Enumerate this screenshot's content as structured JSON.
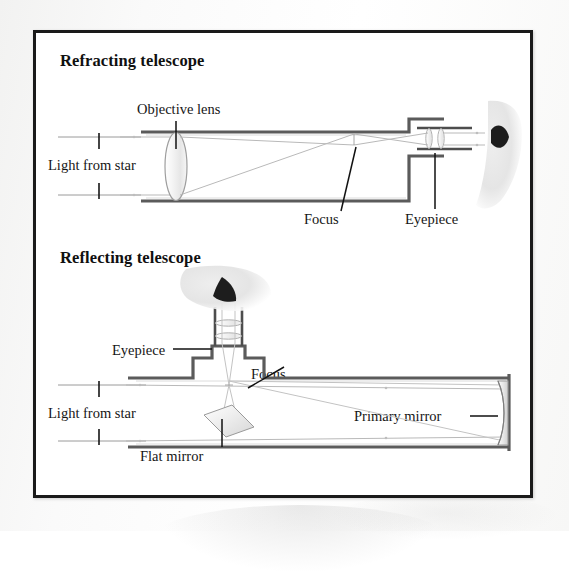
{
  "figure": {
    "panels": [
      {
        "id": "refracting",
        "title": "Refracting telescope",
        "labels": {
          "objective_lens": "Objective lens",
          "light_from_star": "Light from star",
          "focus": "Focus",
          "eyepiece": "Eyepiece"
        }
      },
      {
        "id": "reflecting",
        "title": "Reflecting telescope",
        "labels": {
          "eyepiece": "Eyepiece",
          "focus": "Focus",
          "light_from_star": "Light from star",
          "flat_mirror": "Flat mirror",
          "primary_mirror": "Primary mirror"
        }
      }
    ]
  },
  "colors": {
    "frame_border": "#1a1a1a",
    "tube_wall": "#5b5b5b",
    "ray": "#b9b9b9",
    "leader_line": "#111111",
    "text": "#161616",
    "page_background": "#ffffff",
    "glass_fill": "#f0f0f0"
  }
}
